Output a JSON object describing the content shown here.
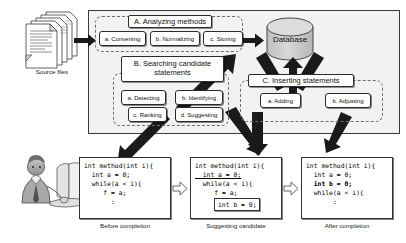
{
  "diagram": {
    "outer_frame_label": "",
    "source_files": {
      "label": "Source files",
      "icon": "document-stack-icon"
    },
    "developer": {
      "icon": "person-at-computer-icon"
    },
    "database": {
      "label": "Database",
      "icon": "database-cylinder-icon"
    },
    "groups": [
      {
        "id": "A",
        "heading": "A. Analyzing methods",
        "steps": [
          {
            "id": "a",
            "label": "a. Converting"
          },
          {
            "id": "b",
            "label": "b. Normalizing"
          },
          {
            "id": "c",
            "label": "c. Storing"
          }
        ]
      },
      {
        "id": "B",
        "heading_line1": "B. Searching candidate",
        "heading_line2": "statements",
        "steps": [
          {
            "id": "a",
            "label": "a. Detecting"
          },
          {
            "id": "b",
            "label": "b. Identifying"
          },
          {
            "id": "c",
            "label": "c. Ranking"
          },
          {
            "id": "d",
            "label": "d. Suggesting"
          }
        ]
      },
      {
        "id": "C",
        "heading": "C. Inserting statements",
        "steps": [
          {
            "id": "a",
            "label": "a. Adding"
          },
          {
            "id": "b",
            "label": "b. Adjusting"
          }
        ]
      }
    ],
    "code_panels": [
      {
        "id": "before",
        "caption": "Before completion",
        "lines": [
          {
            "text": "int method(int i){",
            "style": "plain"
          },
          {
            "text": "  int a = 0;",
            "style": "plain"
          },
          {
            "text": "  while(a < i){",
            "style": "plain"
          },
          {
            "text": "     f = a;",
            "style": "plain"
          },
          {
            "text": "       :",
            "style": "plain"
          }
        ]
      },
      {
        "id": "suggesting",
        "caption": "Suggesting candidate",
        "lines": [
          {
            "text": "int method(int i){",
            "style": "plain"
          },
          {
            "text": "  int a = 0;",
            "style": "underline"
          },
          {
            "text": "  while(a < i){",
            "style": "plain"
          },
          {
            "text": "     f = a;",
            "style": "plain"
          },
          {
            "text": "       :",
            "style": "plain"
          }
        ],
        "callout": "int b = 0;"
      },
      {
        "id": "after",
        "caption": "After completion",
        "lines": [
          {
            "text": "int method(int i){",
            "style": "plain"
          },
          {
            "text": "  int a = 0;",
            "style": "plain"
          },
          {
            "text": "  int b = 0;",
            "style": "bold"
          },
          {
            "text": "  while(a < i){",
            "style": "plain"
          },
          {
            "text": "       :",
            "style": "plain"
          }
        ]
      }
    ],
    "arrows": [
      {
        "from": "source-files",
        "to": "A.a-converting",
        "kind": "thick-black"
      },
      {
        "from": "A.c-storing",
        "to": "database",
        "kind": "thick-black"
      },
      {
        "from": "B",
        "to": "database",
        "kind": "thick-black"
      },
      {
        "from": "database",
        "to": "C",
        "kind": "thick-black"
      },
      {
        "from": "B",
        "to": "before-panel",
        "kind": "thick-black"
      },
      {
        "from": "C.a-adding",
        "to": "suggesting-panel",
        "kind": "thick-black"
      },
      {
        "from": "C.b-adjusting",
        "to": "after-panel",
        "kind": "thick-black"
      },
      {
        "from": "before-panel",
        "to": "suggesting-panel",
        "kind": "hollow-right"
      },
      {
        "from": "suggesting-panel",
        "to": "after-panel",
        "kind": "hollow-right"
      }
    ],
    "colors": {
      "frame_fill": "#f2f2f2",
      "frame_stroke": "#3a3a3a",
      "box_fill": "#ffffff",
      "box_stroke": "#2b2b2b",
      "group_dash": "#6e6e6e",
      "arrow_black": "#1a1a1a",
      "database_fill": "#c9c9c9",
      "database_stroke": "#444444"
    }
  }
}
